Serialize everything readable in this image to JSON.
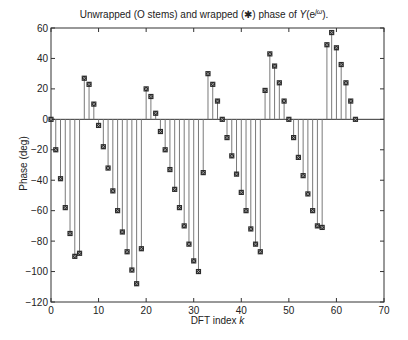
{
  "chart_data": {
    "type": "stem",
    "title_parts": {
      "prefix": "Unwrapped (O stems) and wrapped (",
      "marker": "✱",
      "middle": ") phase of ",
      "func": "Y",
      "arg_open": "(e",
      "sup": "jω",
      "arg_close": ")."
    },
    "xlabel": "DFT index k",
    "xlabel_parts": {
      "text": "DFT index ",
      "var": "k"
    },
    "ylabel": "Phase (deg)",
    "xlim": [
      0,
      70
    ],
    "ylim": [
      -120,
      60
    ],
    "xticks": [
      0,
      10,
      20,
      30,
      40,
      50,
      60,
      70
    ],
    "yticks": [
      60,
      40,
      20,
      0,
      -20,
      -40,
      -60,
      -80,
      -100,
      -120
    ],
    "grid": false,
    "legend": null,
    "series": [
      {
        "name": "wrapped phase",
        "marker": "square-x",
        "x": [
          0,
          1,
          2,
          3,
          4,
          5,
          6,
          7,
          8,
          9,
          10,
          11,
          12,
          13,
          14,
          15,
          16,
          17,
          18,
          19,
          20,
          21,
          22,
          23,
          24,
          25,
          26,
          27,
          28,
          29,
          30,
          31,
          32,
          33,
          34,
          35,
          36,
          37,
          38,
          39,
          40,
          41,
          42,
          43,
          44,
          45,
          46,
          47,
          48,
          49,
          50,
          51,
          52,
          53,
          54,
          55,
          56,
          57,
          58,
          59,
          60,
          61,
          62,
          63,
          64
        ],
        "values": [
          0,
          -20,
          -39,
          -58,
          -75,
          -90,
          -88,
          27,
          23,
          10,
          -4,
          -18,
          -32,
          -47,
          -60,
          -74,
          -87,
          -99,
          -108,
          -85,
          20,
          15,
          4,
          -8,
          -20,
          -33,
          -46,
          -58,
          -70,
          -82,
          -93,
          -100,
          -35,
          30,
          23,
          12,
          0,
          -12,
          -24,
          -36,
          -48,
          -60,
          -72,
          -82,
          -87,
          19,
          43,
          35,
          24,
          12,
          0,
          -12,
          -25,
          -37,
          -49,
          -60,
          -70,
          -71,
          49,
          57,
          47,
          36,
          24,
          12,
          0
        ]
      }
    ]
  },
  "colors": {
    "axis": "#333333",
    "stem": "#7a7a7a",
    "marker": "#2a2a2a",
    "marker_x": "#bbbbbb",
    "background": "#ffffff"
  }
}
